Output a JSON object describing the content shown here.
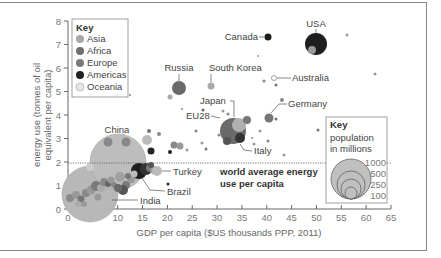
{
  "chart_data": {
    "type": "scatter",
    "subtype": "bubble",
    "title": "",
    "xlabel": "GDP per capita ($US thousands PPP, 2011)",
    "ylabel": "energy use (tonnes of oil equivalent per capita)",
    "xlim": [
      0,
      65
    ],
    "ylim": [
      0,
      8
    ],
    "x_ticks": [
      "0",
      "5",
      "10",
      "15",
      "20",
      "25",
      "30",
      "35",
      "40",
      "45",
      "50",
      "55",
      "60",
      "65"
    ],
    "y_ticks": [
      "0",
      "1",
      "2",
      "3",
      "4",
      "5",
      "6",
      "7",
      "8"
    ],
    "grid": false,
    "reference_line": {
      "y": 1.9,
      "label": "world average energy use per capita",
      "style": "dotted"
    },
    "legend_region": {
      "title": "Key",
      "position": "top-left",
      "entries": [
        {
          "name": "Asia",
          "color": "#a8a8a8"
        },
        {
          "name": "Africa",
          "color": "#6e6e6e"
        },
        {
          "name": "Europe",
          "color": "#7a7a7a"
        },
        {
          "name": "Americas",
          "color": "#222222"
        },
        {
          "name": "Oceania",
          "color": "#e6e6e6"
        }
      ]
    },
    "legend_size": {
      "title": "Key",
      "subtitle": "population in millions",
      "position": "bottom-right",
      "entries": [
        "1000",
        "500",
        "250",
        "100"
      ]
    },
    "labeled_points": [
      {
        "name": "USA",
        "x": 50,
        "y": 7.0,
        "pop": 312,
        "region": "Americas"
      },
      {
        "name": "Canada",
        "x": 41,
        "y": 7.3,
        "pop": 34,
        "region": "Americas"
      },
      {
        "name": "Russia",
        "x": 21.5,
        "y": 5.0,
        "pop": 143,
        "region": "Europe"
      },
      {
        "name": "South Korea",
        "x": 29,
        "y": 5.2,
        "pop": 50,
        "region": "Asia"
      },
      {
        "name": "Australia",
        "x": 43,
        "y": 5.5,
        "pop": 22,
        "region": "Oceania"
      },
      {
        "name": "Japan",
        "x": 34,
        "y": 3.5,
        "pop": 127,
        "region": "Asia"
      },
      {
        "name": "EU28",
        "x": 33,
        "y": 3.3,
        "pop": 505,
        "region": "Europe"
      },
      {
        "name": "Germany",
        "x": 40,
        "y": 3.8,
        "pop": 82,
        "region": "Europe"
      },
      {
        "name": "Italy",
        "x": 33,
        "y": 2.6,
        "pop": 60,
        "region": "Europe"
      },
      {
        "name": "China",
        "x": 10,
        "y": 2.0,
        "pop": 1344,
        "region": "Asia"
      },
      {
        "name": "Turkey",
        "x": 17,
        "y": 1.5,
        "pop": 74,
        "region": "Asia"
      },
      {
        "name": "Brazil",
        "x": 14.5,
        "y": 1.4,
        "pop": 197,
        "region": "Americas"
      },
      {
        "name": "India",
        "x": 4.5,
        "y": 0.6,
        "pop": 1241,
        "region": "Asia"
      }
    ]
  },
  "labels": {
    "key": "Key",
    "key_size_line1": "population",
    "key_size_line2": "in millions",
    "avg_line1": "world average energy",
    "avg_line2": "use per capita",
    "ylabel_line1": "energy use (tonnes of oil",
    "ylabel_line2": "equivalent per capita)",
    "xlabel": "GDP per capita ($US thousands PPP, 2011)"
  }
}
